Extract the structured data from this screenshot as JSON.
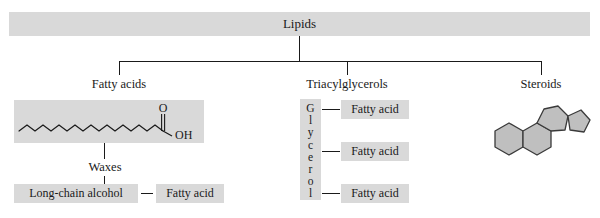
{
  "diagram": {
    "title": "Lipids",
    "width": 600,
    "height": 218,
    "colors": {
      "box_fill": "#d9d9d9",
      "line": "#1a1a1a",
      "background": "#ffffff",
      "steroid_fill": "#bfbfbf"
    }
  },
  "root": {
    "label": "Lipids"
  },
  "categories": [
    {
      "label": "Fatty acids"
    },
    {
      "label": "Triacylglycerols"
    },
    {
      "label": "Steroids"
    }
  ],
  "fatty_acids": {
    "label": "Fatty acids",
    "structure": {
      "type": "skeletal-formula",
      "name": "long-chain-fatty-acid",
      "carbonyl_oxygen": "O",
      "hydroxyl": "OH",
      "zigzag_segments": 16
    },
    "subcategory": {
      "label": "Waxes",
      "components": [
        {
          "label": "Long-chain alcohol"
        },
        {
          "label": "Fatty acid"
        }
      ],
      "connector": "—"
    }
  },
  "triacylglycerols": {
    "label": "Triacylglycerols",
    "backbone": {
      "label": "Glycerol",
      "letters": [
        "G",
        "l",
        "y",
        "c",
        "e",
        "r",
        "o",
        "l"
      ]
    },
    "chains": [
      {
        "label": "Fatty acid"
      },
      {
        "label": "Fatty acid"
      },
      {
        "label": "Fatty acid"
      }
    ]
  },
  "steroids": {
    "label": "Steroids",
    "structure": {
      "type": "skeletal-formula",
      "name": "steroid-nucleus",
      "rings": [
        "A",
        "B",
        "C",
        "D"
      ],
      "ring_shapes": [
        "hexagon",
        "hexagon",
        "hexagon",
        "pentagon"
      ]
    }
  }
}
